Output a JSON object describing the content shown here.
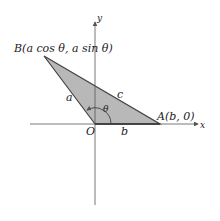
{
  "diagram": {
    "type": "triangle-in-coordinate-plane",
    "axes": {
      "x_label": "x",
      "y_label": "y"
    },
    "points": {
      "origin": {
        "label": "O"
      },
      "A": {
        "label": "A(b, 0)"
      },
      "B": {
        "label": "B(a cos θ, a sin θ)"
      }
    },
    "sides": {
      "a": "a",
      "b": "b",
      "c": "c"
    },
    "angle": "θ",
    "colors": {
      "fill": "#b8b8b8",
      "stroke": "#444444",
      "axis": "#555555"
    }
  }
}
